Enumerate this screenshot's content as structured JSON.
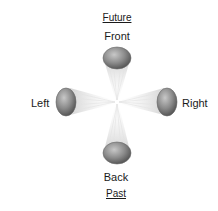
{
  "diagram": {
    "title_top": "Future",
    "title_bottom": "Past",
    "directions": {
      "front": "Front",
      "back": "Back",
      "left": "Left",
      "right": "Right"
    },
    "colors": {
      "ellipse_dark": "#5e5e5e",
      "ellipse_light": "#bdbdbd",
      "beam": "#d8d8d8",
      "text": "#1a1a1a"
    }
  }
}
